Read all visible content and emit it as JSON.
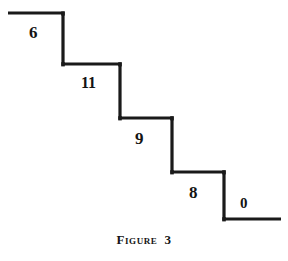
{
  "figure": {
    "caption_word": "Figure",
    "caption_number": "3",
    "caption_full": "FIGURE 3",
    "background_color": "#ffffff",
    "ink_color": "#1a1a1a",
    "stroke_width": 3
  },
  "chart_data": {
    "type": "line",
    "subtitle": "",
    "xlabel": "",
    "ylabel": "",
    "grid": false,
    "legend": null,
    "categories": [
      "6",
      "11",
      "9",
      "8",
      "0"
    ],
    "values": [
      6,
      11,
      9,
      8,
      0
    ],
    "annotations": [
      {
        "text": "6",
        "x": 36,
        "y": 33
      },
      {
        "text": "11",
        "x": 90,
        "y": 84
      },
      {
        "text": "9",
        "x": 142,
        "y": 139
      },
      {
        "text": "8",
        "x": 196,
        "y": 193
      },
      {
        "text": "0",
        "x": 246,
        "y": 205
      }
    ],
    "polyline": [
      {
        "x": 8,
        "y": 13
      },
      {
        "x": 63,
        "y": 13
      },
      {
        "x": 63,
        "y": 64
      },
      {
        "x": 120,
        "y": 64
      },
      {
        "x": 120,
        "y": 118
      },
      {
        "x": 172,
        "y": 118
      },
      {
        "x": 172,
        "y": 172
      },
      {
        "x": 224,
        "y": 172
      },
      {
        "x": 224,
        "y": 219
      },
      {
        "x": 281,
        "y": 219
      }
    ],
    "xlim": [
      0,
      288
    ],
    "ylim": [
      261,
      0
    ]
  },
  "labels": {
    "step_1": "6",
    "step_2": "11",
    "step_3": "9",
    "step_4": "8",
    "step_5": "0"
  }
}
